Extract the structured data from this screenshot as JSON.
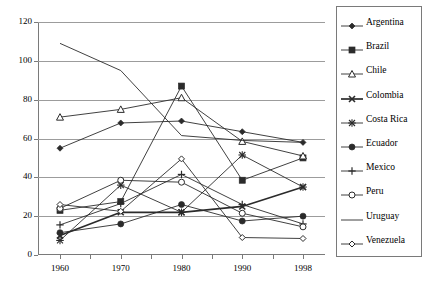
{
  "chart_data": {
    "type": "line",
    "title": "",
    "subtitle": "",
    "xlabel": "",
    "ylabel": "",
    "x": [
      1960,
      1970,
      1980,
      1990,
      1998
    ],
    "xtick_labels": [
      "1960",
      "1970",
      "1980",
      "1990",
      "1998"
    ],
    "ytick_labels": [
      "0",
      "20",
      "40",
      "60",
      "80",
      "100",
      "120"
    ],
    "yticks": [
      0,
      20,
      40,
      60,
      80,
      100,
      120
    ],
    "ylim": [
      0,
      120
    ],
    "grid": "horizontal",
    "legend_position": "right",
    "series": [
      {
        "name": "Argentina",
        "marker": "filled-diamond",
        "values": [
          55,
          68,
          69,
          63.5,
          58
        ]
      },
      {
        "name": "Brazil",
        "marker": "filled-square",
        "values": [
          23,
          27.5,
          87,
          38.5,
          50
        ]
      },
      {
        "name": "Chile",
        "marker": "open-triangle",
        "values": [
          71,
          75,
          81,
          58.5,
          51
        ]
      },
      {
        "name": "Colombia",
        "marker": "bold-cross",
        "values": [
          10,
          22,
          22,
          25,
          35
        ]
      },
      {
        "name": "Costa Rica",
        "marker": "asterisk",
        "values": [
          7.5,
          36,
          22,
          51.5,
          35
        ]
      },
      {
        "name": "Ecuador",
        "marker": "filled-circle",
        "values": [
          11.5,
          16,
          26,
          17.5,
          20
        ]
      },
      {
        "name": "Mexico",
        "marker": "plus",
        "values": [
          15.5,
          26.5,
          41.5,
          26,
          16
        ]
      },
      {
        "name": "Peru",
        "marker": "open-circle",
        "values": [
          24,
          38.5,
          37.5,
          21.5,
          14.5
        ]
      },
      {
        "name": "Uruguay",
        "marker": "none",
        "values": [
          109,
          95,
          61.5,
          59,
          58
        ]
      },
      {
        "name": "Venezuela",
        "marker": "open-diamond",
        "values": [
          26,
          22.5,
          49.5,
          9,
          8.5
        ]
      }
    ]
  },
  "legend": {
    "items": [
      {
        "label": "Argentina"
      },
      {
        "label": "Brazil"
      },
      {
        "label": "Chile"
      },
      {
        "label": "Colombia"
      },
      {
        "label": "Costa Rica"
      },
      {
        "label": "Ecuador"
      },
      {
        "label": "Mexico"
      },
      {
        "label": "Peru"
      },
      {
        "label": "Uruguay"
      },
      {
        "label": "Venezuela"
      }
    ]
  },
  "colors": {
    "line": "#2b2b2b",
    "grid": "#9c9c9c",
    "axis": "#7a7a7a",
    "text": "#000000",
    "background": "#ffffff"
  }
}
